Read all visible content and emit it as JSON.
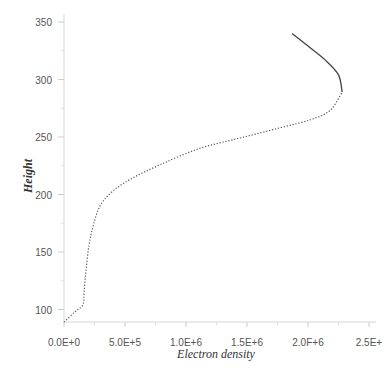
{
  "chart_data": {
    "type": "line",
    "title": "",
    "xlabel": "Electron density",
    "ylabel": "Height",
    "xlim": [
      0,
      2500000
    ],
    "ylim": [
      89,
      360
    ],
    "grid": false,
    "legend": null,
    "x_ticks": [
      {
        "value": 0,
        "label": "0.0E+0"
      },
      {
        "value": 500000,
        "label": "5.0E+5"
      },
      {
        "value": 1000000,
        "label": "1.0E+6"
      },
      {
        "value": 1500000,
        "label": "1.5E+6"
      },
      {
        "value": 2000000,
        "label": "2.0F+6"
      },
      {
        "value": 2500000,
        "label": "2.5E+"
      }
    ],
    "y_ticks": [
      {
        "value": 100,
        "label": "100"
      },
      {
        "value": 150,
        "label": "150"
      },
      {
        "value": 200,
        "label": "200"
      },
      {
        "value": 250,
        "label": "250"
      },
      {
        "value": 300,
        "label": "300"
      },
      {
        "value": 350,
        "label": "350"
      }
    ],
    "series": [
      {
        "name": "bottomside (dotted)",
        "style": "dotted",
        "color": "#555555",
        "points": [
          [
            0,
            89
          ],
          [
            90000,
            98
          ],
          [
            155000,
            104
          ],
          [
            165000,
            115
          ],
          [
            180000,
            134
          ],
          [
            205000,
            156
          ],
          [
            240000,
            173
          ],
          [
            295000,
            190
          ],
          [
            390000,
            202
          ],
          [
            540000,
            213
          ],
          [
            790000,
            226
          ],
          [
            1110000,
            240
          ],
          [
            1440000,
            249
          ],
          [
            1770000,
            258
          ],
          [
            2020000,
            265
          ],
          [
            2180000,
            273
          ],
          [
            2280000,
            289
          ]
        ]
      },
      {
        "name": "topside (solid)",
        "style": "solid",
        "color": "#444444",
        "points": [
          [
            2280000,
            289
          ],
          [
            2250000,
            304
          ],
          [
            2140000,
            317
          ],
          [
            2000000,
            329
          ],
          [
            1870000,
            340
          ]
        ]
      }
    ]
  }
}
